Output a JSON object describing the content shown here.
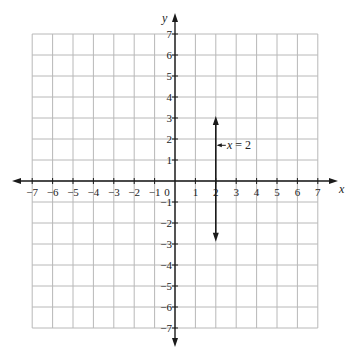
{
  "chart_data": {
    "type": "line",
    "title": "",
    "xlabel": "x",
    "ylabel": "y",
    "xlim": [
      -7,
      7
    ],
    "ylim": [
      -7,
      7
    ],
    "grid": true,
    "x_ticks": [
      -7,
      -6,
      -5,
      -4,
      -3,
      -2,
      -1,
      0,
      1,
      2,
      3,
      4,
      5,
      6,
      7
    ],
    "y_ticks": [
      -7,
      -6,
      -5,
      -4,
      -3,
      -2,
      -1,
      1,
      2,
      3,
      4,
      5,
      6,
      7
    ],
    "x_tick_labels": [
      "−7",
      "−6",
      "−5",
      "−4",
      "−3",
      "−2",
      "−1",
      "0",
      "1",
      "2",
      "3",
      "4",
      "5",
      "6",
      "7"
    ],
    "y_tick_labels": [
      "−7",
      "−6",
      "−5",
      "−4",
      "−3",
      "−2",
      "−1",
      "1",
      "2",
      "3",
      "4",
      "5",
      "6",
      "7"
    ],
    "series": [
      {
        "name": "x = 2",
        "kind": "vertical-line",
        "x": [
          2,
          2
        ],
        "y": [
          -2.8,
          3
        ],
        "arrows": "both"
      }
    ],
    "annotations": [
      {
        "text": "x = 2",
        "points_to": [
          2,
          1.7
        ]
      }
    ]
  },
  "labels": {
    "x_axis": "x",
    "y_axis": "y",
    "equation_var": "x",
    "equation_rest": " = 2"
  },
  "colors": {
    "grid": "#b8b8b8",
    "axis": "#1a1a1a",
    "line": "#1a1a1a"
  }
}
